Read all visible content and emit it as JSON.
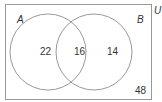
{
  "diagram": {
    "type": "venn",
    "universe_label": "U",
    "sets": [
      {
        "label": "A",
        "only_count": "22"
      },
      {
        "label": "B",
        "only_count": "14"
      }
    ],
    "intersection_count": "16",
    "outside_count": "48",
    "colors": {
      "stroke": "#999999",
      "text": "#333333"
    }
  }
}
